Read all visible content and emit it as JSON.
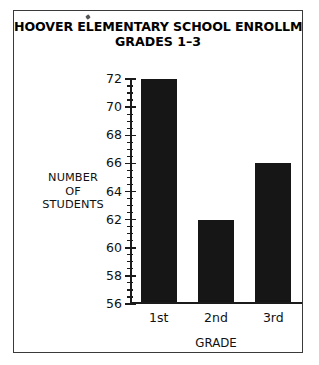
{
  "chart_data": {
    "type": "bar",
    "title": "HOOVER ELEMENTARY SCHOOL ENROLLMENT",
    "subtitle": "GRADES 1–3",
    "categories": [
      "1st",
      "2nd",
      "3rd"
    ],
    "values": [
      72,
      62,
      66
    ],
    "xlabel": "GRADE",
    "ylabel_lines": [
      "NUMBER",
      "OF",
      "STUDENTS"
    ],
    "ylim": [
      56,
      72
    ],
    "ytick_labels": [
      "72",
      "70",
      "68",
      "66",
      "64",
      "62",
      "60",
      "58",
      "56"
    ],
    "ytick_values": [
      72,
      70,
      68,
      66,
      64,
      62,
      60,
      58,
      56
    ],
    "minor_tick_step": 0.5,
    "major_tick_step": 2,
    "grid": false,
    "legend": false,
    "bar_color": "#161616",
    "axis_color": "#1b1b1b",
    "border_color": "#3a3a3a",
    "background": "#ffffff"
  }
}
